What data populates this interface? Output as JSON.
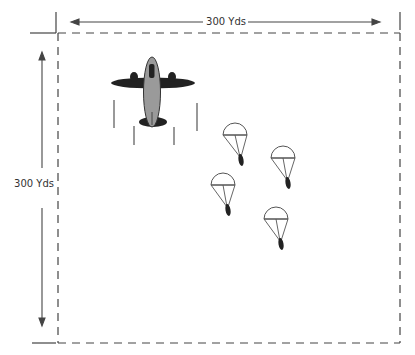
{
  "diagram": {
    "horizontal_dimension": {
      "label": "300 Yds"
    },
    "vertical_dimension": {
      "label": "300 Yds"
    },
    "drop_zone": {
      "shape": "square",
      "border": "dashed"
    },
    "aircraft": {
      "icon": "airplane-icon",
      "count": 1
    },
    "parachutists": {
      "icon": "parachute-icon",
      "count": 4
    },
    "colors": {
      "line": "#333333",
      "fuselage": "#9a9a9a",
      "wings": "#222222",
      "background": "#ffffff"
    }
  }
}
